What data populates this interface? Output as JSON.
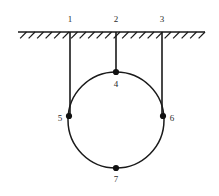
{
  "figure": {
    "background_color": "#ffffff",
    "stroke_color": "#1a1a1a",
    "node_color": "#111111",
    "label_color": "#2b2b2b"
  },
  "ceiling": {
    "name": "hatched-ceiling",
    "line_y": 32,
    "x_start": 18,
    "x_end": 205,
    "hatch_count": 22,
    "hatch_length": 9,
    "hatch_angle_deg": 45
  },
  "circle": {
    "name": "ring",
    "cx": 116,
    "cy": 120,
    "r": 48
  },
  "cords": [
    {
      "name": "cord-1",
      "x": 70,
      "y_top": 32,
      "y_bottom": 116
    },
    {
      "name": "cord-2",
      "x": 116,
      "y_top": 32,
      "y_bottom": 72
    },
    {
      "name": "cord-3",
      "x": 162,
      "y_top": 32,
      "y_bottom": 116
    }
  ],
  "labels": {
    "anchor_1": "1",
    "anchor_2": "2",
    "anchor_3": "3",
    "node_4": "4",
    "node_5": "5",
    "node_6": "6",
    "node_7": "7"
  },
  "label_positions": {
    "anchor_1": {
      "x": 70,
      "y": 22
    },
    "anchor_2": {
      "x": 116,
      "y": 22
    },
    "anchor_3": {
      "x": 162,
      "y": 22
    },
    "node_4": {
      "x": 116,
      "y": 87
    },
    "node_5": {
      "x": 60,
      "y": 121
    },
    "node_6": {
      "x": 172,
      "y": 121
    },
    "node_7": {
      "x": 116,
      "y": 182
    }
  },
  "nodes": [
    {
      "name": "node-4-top",
      "cx": 116,
      "cy": 72,
      "r": 3.1
    },
    {
      "name": "node-5-left",
      "cx": 69,
      "cy": 116,
      "r": 3.1
    },
    {
      "name": "node-6-right",
      "cx": 163,
      "cy": 116,
      "r": 3.1
    },
    {
      "name": "node-7-bottom",
      "cx": 116,
      "cy": 168,
      "r": 3.1
    }
  ]
}
